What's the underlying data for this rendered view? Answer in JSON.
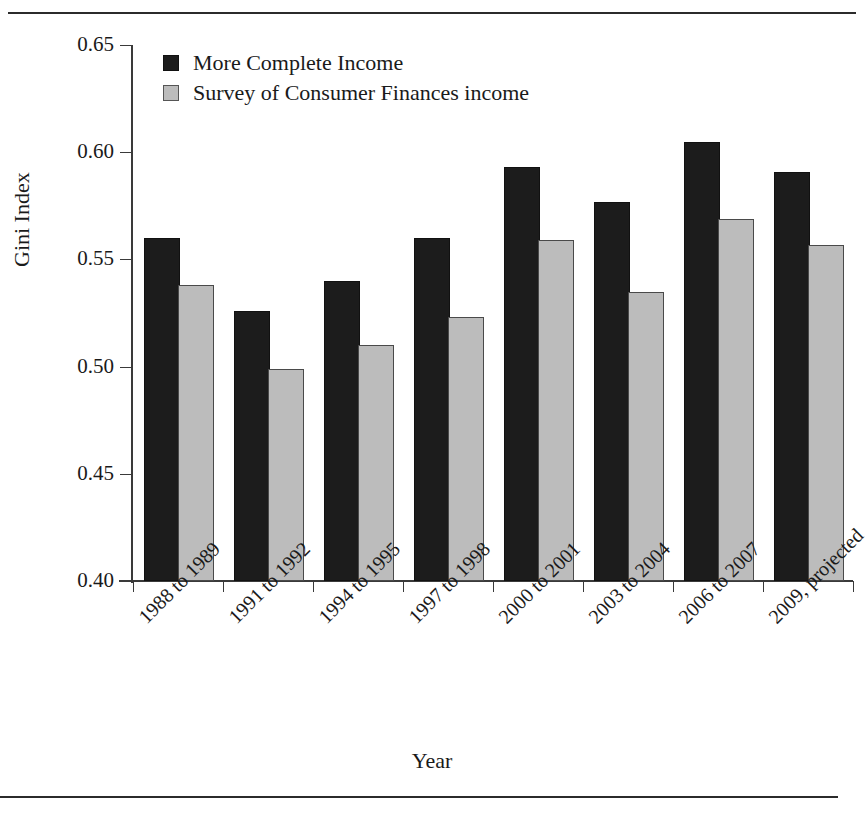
{
  "figure": {
    "y_axis_title": "Gini Index",
    "x_axis_title": "Year"
  },
  "legend": {
    "items": [
      {
        "label": "More Complete Income",
        "swatch": "dark-square-icon",
        "color": "#1c1c1c"
      },
      {
        "label": "Survey of Consumer Finances income",
        "swatch": "light-square-icon",
        "color": "#bcbcbc"
      }
    ]
  },
  "y_axis": {
    "ticks": [
      "0.65",
      "0.60",
      "0.55",
      "0.50",
      "0.45",
      "0.40"
    ]
  },
  "chart_data": {
    "type": "bar",
    "title": "",
    "xlabel": "Year",
    "ylabel": "Gini Index",
    "ylim": [
      0.4,
      0.65
    ],
    "ytick_values": [
      0.4,
      0.45,
      0.5,
      0.55,
      0.6,
      0.65
    ],
    "ytick_labels": [
      "0.40",
      "0.45",
      "0.50",
      "0.55",
      "0.60",
      "0.65"
    ],
    "grid": false,
    "legend_position": "top-left inside axes",
    "categories": [
      "1988 to 1989",
      "1991 to 1992",
      "1994 to 1995",
      "1997 to 1998",
      "2000 to 2001",
      "2003 to 2004",
      "2006 to 2007",
      "2009, projected"
    ],
    "series": [
      {
        "name": "More Complete Income",
        "color": "#1c1c1c",
        "values": [
          0.559,
          0.525,
          0.539,
          0.559,
          0.592,
          0.576,
          0.604,
          0.59
        ]
      },
      {
        "name": "Survey of Consumer Finances income",
        "color": "#bcbcbc",
        "values": [
          0.537,
          0.498,
          0.509,
          0.522,
          0.558,
          0.534,
          0.568,
          0.556
        ]
      }
    ]
  }
}
